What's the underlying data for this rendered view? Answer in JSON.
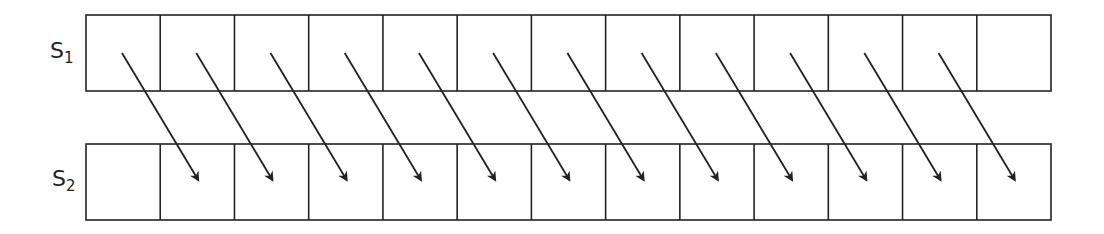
{
  "diagram": {
    "rows": [
      {
        "label": "S",
        "subscript": "1",
        "cells": 13
      },
      {
        "label": "S",
        "subscript": "2",
        "cells": 13
      }
    ],
    "arrows": {
      "count": 12,
      "from": "S1 cell i",
      "to": "S2 cell i+1"
    },
    "colors": {
      "stroke": "#222222",
      "background": "#ffffff"
    }
  }
}
